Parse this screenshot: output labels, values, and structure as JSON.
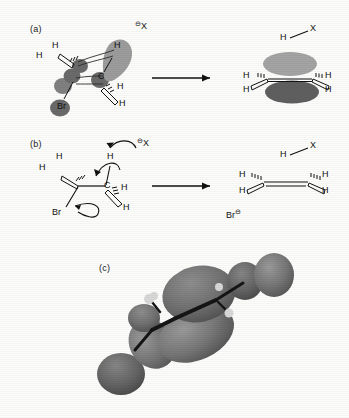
{
  "figure": {
    "background": "#fdfdfc",
    "panels": [
      {
        "id": "a",
        "label": "(a)"
      },
      {
        "id": "b",
        "label": "(b)"
      },
      {
        "id": "c",
        "label": "(c)"
      }
    ]
  },
  "panel_a": {
    "label": "(a)",
    "caption_role": "orbital-overlap-picture-of-E2-transition-state",
    "reagent": {
      "symbol": "X",
      "charge": "⊖",
      "name": "base-anion-label"
    },
    "reactant_atoms": {
      "carbon_alpha": "C",
      "hydrogens": [
        "H",
        "H",
        "H",
        "H"
      ],
      "leaving_group": "Br"
    },
    "product_atoms": {
      "hydrogens": [
        "H",
        "H",
        "H",
        "H"
      ],
      "byproduct_h": "H",
      "byproduct_x": "X"
    },
    "arrow": "reaction-arrow",
    "orbital_colors": {
      "forming_lobe": "#9c9c9c",
      "atom_sphere": "#6a6a6a",
      "pi_top": "#8a8a8a",
      "pi_bottom": "#636363"
    }
  },
  "panel_b": {
    "label": "(b)",
    "caption_role": "curly-arrow-mechanism-of-E2",
    "reagent": {
      "symbol": "X",
      "charge": "⊖"
    },
    "reactant_atoms": {
      "carbon_alpha": "C",
      "hydrogens": [
        "H",
        "H",
        "H",
        "H"
      ],
      "leaving_group": "Br"
    },
    "curly_arrows": [
      "base-to-hydrogen",
      "ch-bond-to-cc",
      "c-br-bond-to-bromide"
    ],
    "product_atoms": {
      "hydrogens": [
        "H",
        "H",
        "H",
        "H"
      ]
    },
    "byproducts": [
      {
        "symbol": "H",
        "partner": "X",
        "bond": "—"
      },
      {
        "symbol": "Br",
        "charge": "⊖"
      }
    ],
    "arrow": "reaction-arrow"
  },
  "panel_c": {
    "label": "(c)",
    "caption_role": "computed-molecular-orbital-surface-of-transition-state",
    "colors": {
      "lobe_primary": "#6e6e6e",
      "lobe_secondary": "#5a5a5a",
      "lobe_tertiary": "#7b7b7b",
      "hydrogen": "#d8d8d8",
      "bond_stick": "#151515"
    }
  }
}
